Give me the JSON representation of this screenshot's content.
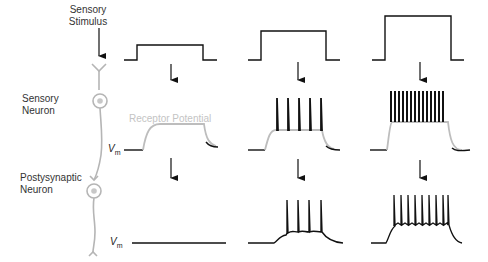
{
  "labels": {
    "sensory_stimulus_line1": "Sensory",
    "sensory_stimulus_line2": "Stimulus",
    "sensory_neuron_line1": "Sensory",
    "sensory_neuron_line2": "Neuron",
    "postsynaptic_neuron_line1": "Postysynaptic",
    "postsynaptic_neuron_line2": "Neuron",
    "receptor_potential": "Receptor Potential",
    "vm_main": "V",
    "vm_sub": "m"
  },
  "colors": {
    "trace": "#111111",
    "receptor_potential": "#bdbdbd",
    "neuron": "#b5b5b5"
  },
  "panels": [
    {
      "stimulus_strength": "weak",
      "sensory_spikes": 0,
      "postsynaptic_spikes": 0
    },
    {
      "stimulus_strength": "medium",
      "sensory_spikes": 5,
      "postsynaptic_spikes": 4
    },
    {
      "stimulus_strength": "strong",
      "sensory_spikes": 14,
      "postsynaptic_spikes": 10
    }
  ]
}
